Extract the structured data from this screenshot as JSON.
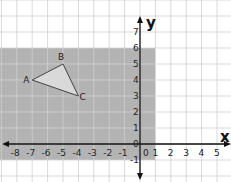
{
  "diagram": {
    "type": "coordinate-plane",
    "x_axis": {
      "label": "x",
      "tick_labels": [
        "-8",
        "-7",
        "-6",
        "-5",
        "-4",
        "-3",
        "-2",
        "-1",
        "0",
        "1",
        "2",
        "3",
        "4",
        "5"
      ]
    },
    "y_axis": {
      "label": "y",
      "tick_labels": [
        "-1",
        "0",
        "1",
        "2",
        "3",
        "4",
        "5",
        "6",
        "7"
      ]
    },
    "shaded_region": {
      "x_from": -9,
      "x_to": 1,
      "y_from": -1,
      "y_to": 6,
      "color": "#b3b3b3"
    },
    "triangle": {
      "vertices": [
        {
          "name": "A",
          "x": -7,
          "y": 4
        },
        {
          "name": "B",
          "x": -5,
          "y": 5
        },
        {
          "name": "C",
          "x": -4,
          "y": 3
        }
      ],
      "fill": "#d9d9d9"
    },
    "colors": {
      "grid": "#d0d0d0",
      "axis": "#111111",
      "background": "#ffffff"
    }
  }
}
